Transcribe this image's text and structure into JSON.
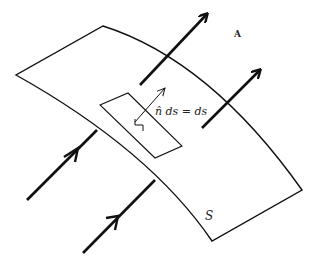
{
  "diagram": {
    "title": "",
    "labels": {
      "field": "A",
      "element_eq": "n̂ ds = ds",
      "surface": "S"
    },
    "elements": {
      "surface": "curved surface S",
      "patch": "small area element ds on surface",
      "normal": "unit normal vector n̂",
      "field_arrows_count": 4
    },
    "colors": {
      "stroke": "#111111",
      "background": "#ffffff"
    }
  }
}
